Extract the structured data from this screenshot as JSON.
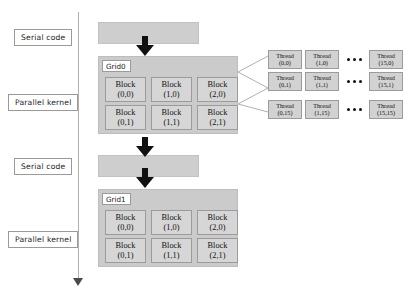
{
  "diagram": {
    "colors": {
      "serial_bar": "#cecece",
      "grid_panel": "#cbcbcb",
      "block_box": "#d6d6d6",
      "thread_box": "#d2d2d2",
      "arrow": "#111111",
      "timeline": "#b0b0b0",
      "label_border": "#9a9a9a"
    }
  },
  "side_labels": [
    {
      "id": "serial-1",
      "text": "Serial code"
    },
    {
      "id": "parallel-1",
      "text": "Parallel kernel"
    },
    {
      "id": "serial-2",
      "text": "Serial code"
    },
    {
      "id": "parallel-2",
      "text": "Parallel kernel"
    }
  ],
  "grids": [
    {
      "title": "Grid0",
      "rows": [
        [
          {
            "name": "Block",
            "coord": "(0,0)"
          },
          {
            "name": "Block",
            "coord": "(1,0)"
          },
          {
            "name": "Block",
            "coord": "(2,0)"
          }
        ],
        [
          {
            "name": "Block",
            "coord": "(0,1)"
          },
          {
            "name": "Block",
            "coord": "(1,1)"
          },
          {
            "name": "Block",
            "coord": "(2,1)"
          }
        ]
      ]
    },
    {
      "title": "Grid1",
      "rows": [
        [
          {
            "name": "Block",
            "coord": "(0,0)"
          },
          {
            "name": "Block",
            "coord": "(1,0)"
          },
          {
            "name": "Block",
            "coord": "(2,0)"
          }
        ],
        [
          {
            "name": "Block",
            "coord": "(0,1)"
          },
          {
            "name": "Block",
            "coord": "(1,1)"
          },
          {
            "name": "Block",
            "coord": "(2,1)"
          }
        ]
      ]
    }
  ],
  "thread_detail": {
    "rows": [
      {
        "left": [
          {
            "name": "Thread",
            "coord": "(0,0)"
          },
          {
            "name": "Thread",
            "coord": "(1,0)"
          }
        ],
        "ellipsis": "•••",
        "right": {
          "name": "Thread",
          "coord": "(15,0)"
        }
      },
      {
        "left": [
          {
            "name": "Thread",
            "coord": "(0,1)"
          },
          {
            "name": "Thread",
            "coord": "(1,1)"
          }
        ],
        "ellipsis": "•••",
        "right": {
          "name": "Thread",
          "coord": "(15,1)"
        }
      },
      {
        "left": [
          {
            "name": "Thread",
            "coord": "(0,15)"
          },
          {
            "name": "Thread",
            "coord": "(1,15)"
          }
        ],
        "ellipsis": "•••",
        "right": {
          "name": "Thread",
          "coord": "(15,15)"
        }
      }
    ]
  }
}
